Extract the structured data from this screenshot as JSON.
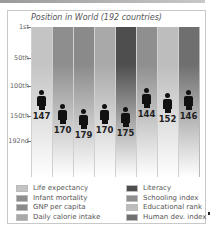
{
  "chart_data": {
    "type": "bar",
    "title": "Position in World (192 countries)",
    "xlabel": "",
    "ylabel": "",
    "y_ticks": [
      "1st",
      "50th",
      "100th",
      "150th",
      "192nd"
    ],
    "ylim": [
      1,
      192
    ],
    "y_inverted": true,
    "grid": true,
    "legend_position": "bottom",
    "categories": [
      "Life expectancy",
      "Infant mortality",
      "GNP per capita",
      "Daily calorie intake",
      "Literacy",
      "Schooling index",
      "Educational rank",
      "Human dev. index"
    ],
    "values": [
      147,
      170,
      179,
      170,
      175,
      144,
      152,
      146
    ],
    "marker": "person-icon",
    "colors": [
      "#c4c4c4",
      "#8e8e8e",
      "#8a8a8a",
      "#a9a9a9",
      "#4e4e4e",
      "#8f8f8f",
      "#bdbdbd",
      "#6f6f6f"
    ]
  },
  "title": "Position in World (192 countries)",
  "y_axis": {
    "ticks": [
      {
        "label": "1st",
        "top": 27
      },
      {
        "label": "50th",
        "top": 58
      },
      {
        "label": "100th",
        "top": 86
      },
      {
        "label": "150th",
        "top": 116
      },
      {
        "label": "192nd",
        "top": 141
      }
    ]
  },
  "columns": [
    {
      "label": "Life expectancy",
      "value": "147",
      "color": "#c4c4c4"
    },
    {
      "label": "Infant mortality",
      "value": "170",
      "color": "#8e8e8e"
    },
    {
      "label": "GNP per capita",
      "value": "179",
      "color": "#8a8a8a"
    },
    {
      "label": "Daily calorie intake",
      "value": "170",
      "color": "#a9a9a9"
    },
    {
      "label": "Literacy",
      "value": "175",
      "color": "#4e4e4e"
    },
    {
      "label": "Schooling index",
      "value": "144",
      "color": "#8f8f8f"
    },
    {
      "label": "Educational rank",
      "value": "152",
      "color": "#bdbdbd"
    },
    {
      "label": "Human dev. index",
      "value": "146",
      "color": "#6f6f6f"
    }
  ],
  "legend": {
    "left": [
      "Life expectancy",
      "Infant mortality",
      "GNP per capita",
      "Daily calorie intake"
    ],
    "right": [
      "Literacy",
      "Schooling index",
      "Educational rank",
      "Human dev. index"
    ]
  }
}
